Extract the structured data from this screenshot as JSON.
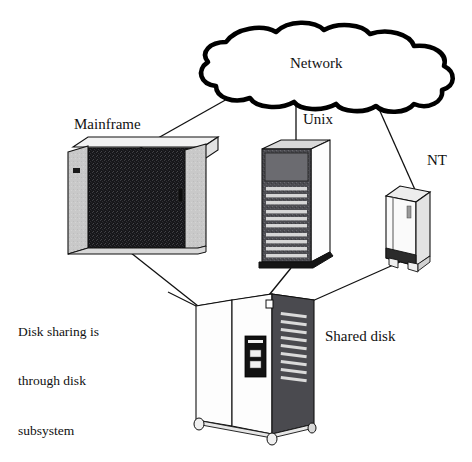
{
  "diagram": {
    "background_color": "#ffffff",
    "ink_color": "#000000",
    "labels": {
      "network": "Network",
      "mainframe": "Mainframe",
      "unix": "Unix",
      "nt": "NT",
      "shared_disk": "Shared disk",
      "caption_line1": "Disk sharing is",
      "caption_line2": "through disk",
      "caption_line3": "subsystem"
    },
    "nodes": [
      {
        "id": "network-cloud",
        "name": "network-cloud",
        "label": "Network",
        "shape": "cloud",
        "outline_color": "#000000",
        "fill_color": "#ffffff"
      },
      {
        "id": "mainframe",
        "name": "mainframe-computer",
        "label": "Mainframe",
        "shape": "wide-cabinet",
        "panel_color": "#c9c9c9",
        "front_color": "#1a1a1a"
      },
      {
        "id": "unix-server",
        "name": "unix-server",
        "label": "Unix",
        "shape": "tall-tower",
        "front_color": "#3a3a3a",
        "side_color": "#ffffff"
      },
      {
        "id": "nt-server",
        "name": "nt-server",
        "label": "NT",
        "shape": "small-tower",
        "front_color": "#ffffff",
        "base_color": "#2b2b2b"
      },
      {
        "id": "shared-disk",
        "name": "shared-disk-subsystem",
        "label": "Shared disk",
        "shape": "double-door-cabinet",
        "door_color": "#ffffff",
        "side_color": "#4a4a4a",
        "control_panel_color": "#111111"
      }
    ],
    "connections": [
      {
        "from": "network-cloud",
        "to": "mainframe",
        "style": "solid"
      },
      {
        "from": "network-cloud",
        "to": "unix-server",
        "style": "solid"
      },
      {
        "from": "network-cloud",
        "to": "nt-server",
        "style": "solid"
      },
      {
        "from": "mainframe",
        "to": "shared-disk",
        "style": "solid"
      },
      {
        "from": "unix-server",
        "to": "shared-disk",
        "style": "solid"
      },
      {
        "from": "nt-server",
        "to": "shared-disk",
        "style": "solid"
      }
    ]
  }
}
